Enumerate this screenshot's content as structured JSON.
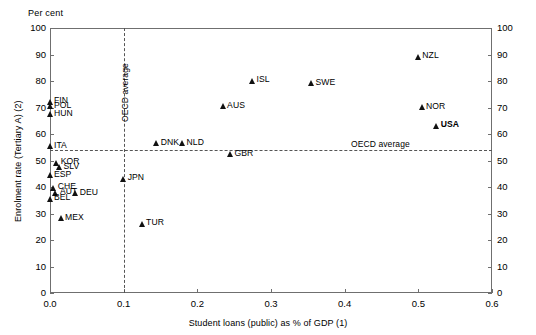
{
  "chart_data": {
    "type": "scatter",
    "title": "",
    "unit_label": "Per cent",
    "xlabel": "Student loans (public) as % of GDP (1)",
    "ylabel": "Enrolment rate (Tertiary A) (2)",
    "xlim": [
      0.0,
      0.6
    ],
    "ylim": [
      0,
      100
    ],
    "xticks": [
      "0.0",
      "0.1",
      "0.2",
      "0.3",
      "0.4",
      "0.5",
      "0.6"
    ],
    "xtick_values": [
      0.0,
      0.1,
      0.2,
      0.3,
      0.4,
      0.5,
      0.6
    ],
    "yticks": [
      "0",
      "10",
      "20",
      "30",
      "40",
      "50",
      "60",
      "70",
      "80",
      "90",
      "100"
    ],
    "ytick_values": [
      0,
      10,
      20,
      30,
      40,
      50,
      60,
      70,
      80,
      90,
      100
    ],
    "grid": false,
    "legend": "none",
    "axis_right_mirrored": true,
    "marker_shape": "triangle",
    "marker_color": "#111111",
    "reference_lines": [
      {
        "name": "oecd-average-vertical",
        "orientation": "vertical",
        "value": 0.1,
        "label": "OECD average",
        "style": "dashed"
      },
      {
        "name": "oecd-average-horizontal",
        "orientation": "horizontal",
        "value": 54,
        "label": "OECD average",
        "style": "dashed"
      }
    ],
    "points": [
      {
        "label": "FIN",
        "x": 0.0,
        "y": 72.0,
        "label_side": "right",
        "bold": false
      },
      {
        "label": "POL",
        "x": 0.0,
        "y": 70.3,
        "label_side": "right",
        "bold": false
      },
      {
        "label": "HUN",
        "x": 0.0,
        "y": 67.3,
        "label_side": "right",
        "bold": false
      },
      {
        "label": "ITA",
        "x": 0.0,
        "y": 55.2,
        "label_side": "right",
        "bold": false
      },
      {
        "label": "KOR",
        "x": 0.009,
        "y": 49.0,
        "label_side": "right",
        "bold": false
      },
      {
        "label": "SLV",
        "x": 0.013,
        "y": 47.3,
        "label_side": "right",
        "bold": false
      },
      {
        "label": "ESP",
        "x": 0.0,
        "y": 44.3,
        "label_side": "right",
        "bold": false
      },
      {
        "label": "CHE",
        "x": 0.005,
        "y": 39.6,
        "label_side": "right",
        "bold": false
      },
      {
        "label": "AUT",
        "x": 0.008,
        "y": 37.6,
        "label_side": "right",
        "bold": false
      },
      {
        "label": "BEL",
        "x": 0.0,
        "y": 35.4,
        "label_side": "right",
        "bold": false
      },
      {
        "label": "DEU",
        "x": 0.035,
        "y": 37.4,
        "label_side": "right",
        "bold": false
      },
      {
        "label": "MEX",
        "x": 0.015,
        "y": 28.0,
        "label_side": "right",
        "bold": false
      },
      {
        "label": "JPN",
        "x": 0.1,
        "y": 43.0,
        "label_side": "right",
        "bold": false
      },
      {
        "label": "TUR",
        "x": 0.125,
        "y": 26.0,
        "label_side": "right",
        "bold": false
      },
      {
        "label": "DNK",
        "x": 0.145,
        "y": 56.3,
        "label_side": "right",
        "bold": false
      },
      {
        "label": "NLD",
        "x": 0.18,
        "y": 56.3,
        "label_side": "right",
        "bold": false
      },
      {
        "label": "GBR",
        "x": 0.245,
        "y": 52.2,
        "label_side": "right",
        "bold": false
      },
      {
        "label": "AUS",
        "x": 0.235,
        "y": 70.2,
        "label_side": "right",
        "bold": false
      },
      {
        "label": "ISL",
        "x": 0.275,
        "y": 80.0,
        "label_side": "right",
        "bold": false
      },
      {
        "label": "SWE",
        "x": 0.355,
        "y": 79.0,
        "label_side": "right",
        "bold": false
      },
      {
        "label": "NZL",
        "x": 0.5,
        "y": 89.0,
        "label_side": "right",
        "bold": false
      },
      {
        "label": "NOR",
        "x": 0.505,
        "y": 70.0,
        "label_side": "right",
        "bold": false
      },
      {
        "label": "USA",
        "x": 0.525,
        "y": 63.0,
        "label_side": "right",
        "bold": true
      }
    ]
  }
}
